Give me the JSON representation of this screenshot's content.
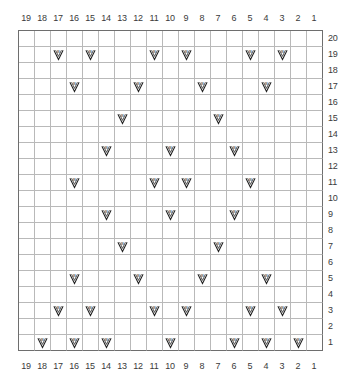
{
  "chart_data": {
    "type": "table",
    "title": "",
    "xlabel": "",
    "ylabel": "",
    "columns": 19,
    "rows": 20,
    "grid": true,
    "legend": "",
    "symbol_name": "v-with-b",
    "symbol_label": "B",
    "colors": {
      "grid_line": "#b9b9b9",
      "frame_line": "#6e6e6e",
      "symbol": "#1f1f1f",
      "background": "#ffffff",
      "axis_text": "#3a3a3a"
    },
    "column_labels_top": [
      "19",
      "18",
      "17",
      "16",
      "15",
      "14",
      "13",
      "12",
      "11",
      "10",
      "9",
      "8",
      "7",
      "6",
      "5",
      "4",
      "3",
      "2",
      "1"
    ],
    "column_labels_bottom": [
      "19",
      "18",
      "17",
      "16",
      "15",
      "14",
      "13",
      "12",
      "11",
      "10",
      "9",
      "8",
      "7",
      "6",
      "5",
      "4",
      "3",
      "2",
      "1"
    ],
    "row_labels_right": [
      "20",
      "19",
      "18",
      "17",
      "16",
      "15",
      "14",
      "13",
      "12",
      "11",
      "10",
      "9",
      "8",
      "7",
      "6",
      "5",
      "4",
      "3",
      "2",
      "1"
    ],
    "marked_cells": [
      {
        "row": 20,
        "columns": []
      },
      {
        "row": 19,
        "columns": [
          17,
          15,
          11,
          9,
          5,
          3
        ]
      },
      {
        "row": 18,
        "columns": []
      },
      {
        "row": 17,
        "columns": [
          16,
          12,
          8,
          4
        ]
      },
      {
        "row": 16,
        "columns": []
      },
      {
        "row": 15,
        "columns": [
          13,
          7
        ]
      },
      {
        "row": 14,
        "columns": []
      },
      {
        "row": 13,
        "columns": [
          14,
          10,
          6
        ]
      },
      {
        "row": 12,
        "columns": []
      },
      {
        "row": 11,
        "columns": [
          16,
          11,
          9,
          5
        ]
      },
      {
        "row": 10,
        "columns": []
      },
      {
        "row": 9,
        "columns": [
          14,
          10,
          6
        ]
      },
      {
        "row": 8,
        "columns": []
      },
      {
        "row": 7,
        "columns": [
          13,
          7
        ]
      },
      {
        "row": 6,
        "columns": []
      },
      {
        "row": 5,
        "columns": [
          16,
          12,
          8,
          4
        ]
      },
      {
        "row": 4,
        "columns": []
      },
      {
        "row": 3,
        "columns": [
          17,
          15,
          11,
          9,
          5,
          3
        ]
      },
      {
        "row": 2,
        "columns": []
      },
      {
        "row": 1,
        "columns": [
          18,
          16,
          14,
          10,
          6,
          4,
          2
        ]
      }
    ]
  }
}
